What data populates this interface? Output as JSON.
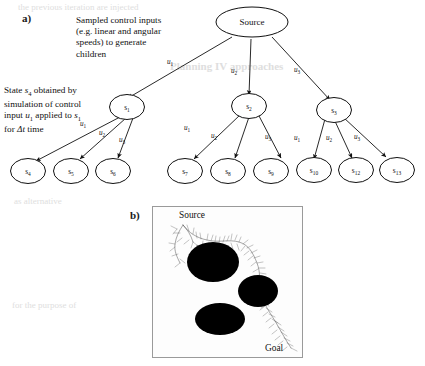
{
  "figure": {
    "width": 425,
    "height": 366,
    "background": "#ffffff",
    "ink_color": "#111111"
  },
  "panel_a": {
    "letter": "a)",
    "annotations": [
      {
        "name": "sampled-control-inputs-note",
        "text": "Sampled control inputs\n(e.g. linear and angular\nspeeds) to generate\nchildren"
      },
      {
        "name": "state-simulation-note",
        "text": "State s4 obtained by\nsimulation of control\ninput u1 applied to s1\nfor Δt time"
      }
    ],
    "root": {
      "label": "Source",
      "name": "node-source"
    },
    "level1": [
      {
        "label": "s",
        "sub": "1",
        "name": "node-s1"
      },
      {
        "label": "s",
        "sub": "2",
        "name": "node-s2"
      },
      {
        "label": "s",
        "sub": "3",
        "name": "node-s3"
      }
    ],
    "level2": [
      {
        "label": "s",
        "sub": "4",
        "name": "node-s4"
      },
      {
        "label": "s",
        "sub": "5",
        "name": "node-s5"
      },
      {
        "label": "s",
        "sub": "6",
        "name": "node-s6"
      },
      {
        "label": "s",
        "sub": "7",
        "name": "node-s7"
      },
      {
        "label": "s",
        "sub": "8",
        "name": "node-s8"
      },
      {
        "label": "s",
        "sub": "9",
        "name": "node-s9"
      },
      {
        "label": "s",
        "sub": "10",
        "name": "node-s10"
      },
      {
        "label": "s",
        "sub": "12",
        "name": "node-s12"
      },
      {
        "label": "s",
        "sub": "13",
        "name": "node-s13"
      }
    ],
    "edge_labels": {
      "root": [
        {
          "label": "u",
          "sub": "1"
        },
        {
          "label": "u",
          "sub": "2"
        },
        {
          "label": "u",
          "sub": "3"
        }
      ],
      "s1": [
        {
          "label": "u",
          "sub": "1"
        },
        {
          "label": "u",
          "sub": "2"
        },
        {
          "label": "u",
          "sub": "3"
        }
      ],
      "s2": [
        {
          "label": "u",
          "sub": "1"
        },
        {
          "label": "u",
          "sub": "2"
        },
        {
          "label": "u",
          "sub": "3"
        }
      ],
      "s3": [
        {
          "label": "u",
          "sub": "1"
        },
        {
          "label": "u",
          "sub": "2"
        },
        {
          "label": "u",
          "sub": "3"
        }
      ]
    }
  },
  "panel_b": {
    "letter": "b)",
    "source_label": "Source",
    "goal_label": "Goal",
    "obstacle_color": "#000000",
    "border_color": "#9a9a9a",
    "obstacles": [
      {
        "name": "obstacle-upper-left",
        "cx": 0.4,
        "cy": 0.36,
        "rx": 0.175,
        "ry": 0.135
      },
      {
        "name": "obstacle-right",
        "cx": 0.695,
        "cy": 0.555,
        "rx": 0.135,
        "ry": 0.108
      },
      {
        "name": "obstacle-lower-left",
        "cx": 0.445,
        "cy": 0.735,
        "rx": 0.165,
        "ry": 0.105
      }
    ]
  },
  "bleed_through_text": [
    "the previous iteration are injected",
    "Planning IV approaches",
    "as alternative",
    "for the purpose of"
  ]
}
